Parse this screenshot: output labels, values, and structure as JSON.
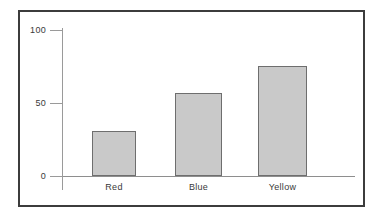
{
  "chart_data": {
    "type": "bar",
    "title": "",
    "subtitle": "",
    "xlabel": "",
    "ylabel": "",
    "categories": [
      "Red",
      "Blue",
      "Yellow"
    ],
    "values": [
      31,
      57,
      75
    ],
    "ylim": [
      0,
      100
    ],
    "yticks": [
      0,
      50,
      100
    ],
    "ytick_labels": [
      "0",
      "50",
      "100"
    ],
    "grid": false,
    "legend": null,
    "series": [
      {
        "name": "",
        "values": [
          31,
          57,
          75
        ]
      }
    ],
    "bar_fill_color": "#c9c9c9",
    "bar_edge_color": "#6e6e6e",
    "axis_color": "#9a9a9a",
    "frame_color": "#3c3c3c",
    "background_color": "#ffffff"
  },
  "axis": {
    "y_tick_0": "0",
    "y_tick_50": "50",
    "y_tick_100": "100"
  },
  "categories": {
    "cat_0": "Red",
    "cat_1": "Blue",
    "cat_2": "Yellow"
  }
}
